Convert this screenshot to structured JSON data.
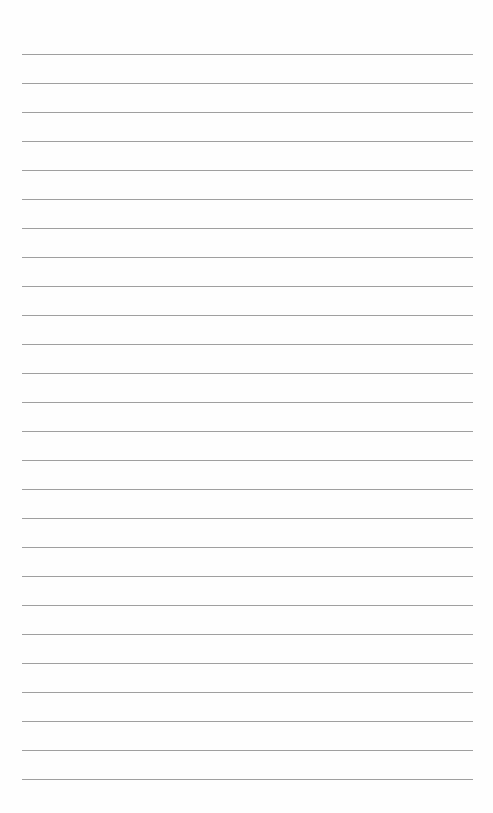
{
  "page": {
    "type": "blank-lined-paper",
    "background": "#fefefe",
    "rule_color": "#8e8e8e",
    "rule_count": 26,
    "first_rule_y": 54,
    "rule_spacing": 29,
    "rule_left": 22,
    "rule_width": 451
  }
}
